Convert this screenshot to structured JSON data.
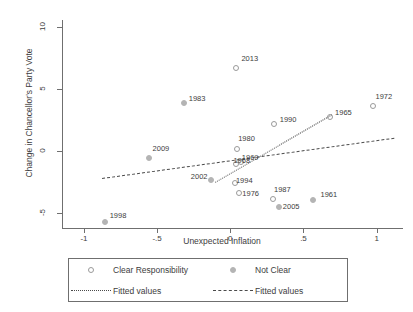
{
  "chart_data": {
    "type": "scatter",
    "title": "",
    "xlabel": "Unexpected Inflation",
    "ylabel": "Change in Chancellor's Party Vote",
    "xlim": [
      -1.15,
      1.18
    ],
    "ylim": [
      -6.2,
      10.6
    ],
    "xticks": [
      -1,
      -0.5,
      0,
      0.5,
      1
    ],
    "xticklabels": [
      "-1",
      "-.5",
      "0",
      ".5",
      "1"
    ],
    "yticks": [
      10,
      5,
      0,
      -5
    ],
    "yticklabels": [
      "10",
      "5",
      "0",
      "-5"
    ],
    "grid": false,
    "legend_position": "below-axes",
    "series": [
      {
        "name": "Clear Responsibility",
        "marker": "open-circle",
        "color": "#9a9a9a",
        "points": [
          {
            "label": "2013",
            "x": 0.035,
            "y": 6.8
          },
          {
            "label": "1972",
            "x": 0.965,
            "y": 3.7
          },
          {
            "label": "1965",
            "x": 0.675,
            "y": 2.85
          },
          {
            "label": "1990",
            "x": 0.29,
            "y": 2.25
          },
          {
            "label": "1980",
            "x": 0.04,
            "y": 0.3
          },
          {
            "label": "1969",
            "x": 0.065,
            "y": -0.75
          },
          {
            "label": "1968",
            "x": 0.035,
            "y": -0.95
          },
          {
            "label": "1994",
            "x": 0.025,
            "y": -2.45
          },
          {
            "label": "1976",
            "x": 0.055,
            "y": -3.3
          },
          {
            "label": "1987",
            "x": 0.285,
            "y": -3.75
          }
        ]
      },
      {
        "name": "Not Clear",
        "marker": "filled-dot",
        "color": "#b4b4b4",
        "points": [
          {
            "label": "1983",
            "x": -0.325,
            "y": 3.95
          },
          {
            "label": "2009",
            "x": -0.565,
            "y": -0.45
          },
          {
            "label": "2002",
            "x": -0.14,
            "y": -2.25
          },
          {
            "label": "2005",
            "x": 0.325,
            "y": -4.4
          },
          {
            "label": "1961",
            "x": 0.555,
            "y": -3.85
          },
          {
            "label": "1998",
            "x": -0.865,
            "y": -5.6
          }
        ]
      }
    ],
    "fits": [
      {
        "name": "Fitted values",
        "style": "dotted",
        "for_series": "Clear Responsibility",
        "x0": -0.105,
        "y0": -2.5,
        "x1": 0.69,
        "y1": 2.95
      },
      {
        "name": "Fitted values",
        "style": "dashed",
        "for_series": "Not Clear",
        "x0": -0.88,
        "y0": -2.2,
        "x1": 1.115,
        "y1": 1.05
      }
    ]
  },
  "legend": {
    "entries": [
      {
        "key": "open-circle",
        "label": "Clear Responsibility"
      },
      {
        "key": "filled-dot",
        "label": "Not Clear"
      },
      {
        "key": "dotted-line",
        "label": "Fitted values"
      },
      {
        "key": "dashed-line",
        "label": "Fitted values"
      }
    ]
  }
}
